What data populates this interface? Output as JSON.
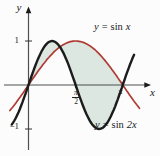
{
  "figure": {
    "background": "#fcfcfc",
    "axis_color": "#4f4f4f",
    "arrow_color": "#1c1c1c",
    "tick_color": "#333333",
    "text_color": "#1a1a1a"
  },
  "axes": {
    "x_label": "x",
    "y_label": "y",
    "x_unit": "radians",
    "y_range": [
      -1,
      1
    ],
    "y_ticks": [
      {
        "label": "1",
        "value": 1
      },
      {
        "label": "−1",
        "value": -1
      }
    ],
    "x_ticks": [
      {
        "type": "fraction",
        "numerator": "π",
        "denominator": "2",
        "value": 1.5707963
      },
      {
        "type": "plain",
        "label": "π",
        "value": 3.1415927
      }
    ]
  },
  "chart_data": {
    "type": "line",
    "title": "",
    "xlabel": "x",
    "ylabel": "y",
    "x_range": [
      -0.62,
      3.7
    ],
    "ylim": [
      -1.25,
      1.6
    ],
    "grid": false,
    "curves": [
      {
        "label": {
          "var": "y",
          "eq": "=",
          "fn": "sin",
          "arg": "x"
        },
        "function": "sin(x)",
        "freq": 1,
        "domain": [
          -0.62,
          3.7
        ],
        "color": "#b03a34",
        "stroke_width": 1.7,
        "key_points": [
          [
            0,
            0
          ],
          [
            1.5708,
            1
          ],
          [
            3.1416,
            0
          ]
        ]
      },
      {
        "label": {
          "var": "y",
          "eq": "=",
          "fn": "sin",
          "arg": "2x"
        },
        "function": "sin(2x)",
        "freq": 2,
        "domain": [
          -0.56,
          3.52
        ],
        "color": "#1c1c1c",
        "stroke_width": 2.4,
        "key_points": [
          [
            0,
            0
          ],
          [
            0.7854,
            1
          ],
          [
            1.5708,
            0
          ],
          [
            2.3562,
            -1
          ],
          [
            3.1416,
            0
          ]
        ]
      }
    ],
    "shaded_region": {
      "description": "area between y = sin 2x and y = sin x from x = 0 to x = π",
      "from": 0,
      "to": 3.1415927,
      "fill": "#dbe7e0",
      "intersections_x": [
        0,
        1.0472,
        3.1416
      ]
    }
  }
}
